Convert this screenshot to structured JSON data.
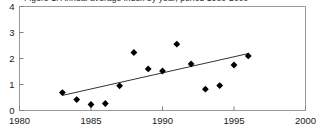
{
  "chart_data": {
    "type": "scatter",
    "title": "Figure 1. Annual average index by year, period 1980-2000",
    "xlabel": "",
    "ylabel": "",
    "xlim": [
      1980,
      2000
    ],
    "ylim": [
      0,
      4
    ],
    "xticks": [
      1980,
      1985,
      1990,
      1995,
      2000
    ],
    "yticks": [
      0,
      1,
      2,
      3,
      4
    ],
    "xtick_labels": [
      "1980",
      "1985",
      "1990",
      "1995",
      "2000"
    ],
    "ytick_labels": [
      "0",
      "1",
      "2",
      "3",
      "4"
    ],
    "grid": false,
    "legend": null,
    "marker": "diamond",
    "marker_color": "#000000",
    "axis_color": "#808080",
    "trendline_color": "#333333",
    "x": [
      1983,
      1984,
      1985,
      1986,
      1987,
      1988,
      1989,
      1990,
      1991,
      1992,
      1993,
      1994,
      1995,
      1996
    ],
    "values": [
      0.69,
      0.42,
      0.23,
      0.27,
      0.95,
      2.23,
      1.6,
      1.52,
      2.55,
      1.79,
      0.82,
      0.96,
      1.75,
      2.1
    ],
    "points": [
      {
        "x": 1983,
        "y": 0.69
      },
      {
        "x": 1984,
        "y": 0.42
      },
      {
        "x": 1985,
        "y": 0.23
      },
      {
        "x": 1986,
        "y": 0.27
      },
      {
        "x": 1987,
        "y": 0.95
      },
      {
        "x": 1988,
        "y": 2.23
      },
      {
        "x": 1989,
        "y": 1.6
      },
      {
        "x": 1990,
        "y": 1.52
      },
      {
        "x": 1991,
        "y": 2.55
      },
      {
        "x": 1992,
        "y": 1.79
      },
      {
        "x": 1993,
        "y": 0.82
      },
      {
        "x": 1994,
        "y": 0.96
      },
      {
        "x": 1995,
        "y": 1.75
      },
      {
        "x": 1996,
        "y": 2.1
      }
    ],
    "trendline": {
      "x0": 1983,
      "y0": 0.58,
      "x1": 1996,
      "y1": 2.19
    }
  }
}
